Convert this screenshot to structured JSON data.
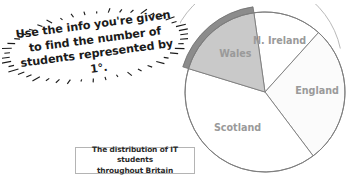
{
  "callout": {
    "name": "instruction-starburst",
    "line1": "Use the info you're given",
    "line2": "to find the number of",
    "line3": "students represented by 1°.",
    "full_text": "Use the info you're given to find the number of students represented by 1°.",
    "rotation_deg": -7.5,
    "ray_count": 46,
    "text_color": "#1b1b1b"
  },
  "caption": {
    "line1": "The distribution of IT students",
    "line2": "throughout Britain",
    "full_text": "The distribution of IT students throughout Britain",
    "border_color": "#b4b4b4",
    "text_color": "#2a2a2a"
  },
  "chart_data": {
    "type": "pie",
    "title": "The distribution of IT students throughout Britain",
    "categories": [
      "N. Ireland",
      "England",
      "Scotland",
      "Wales"
    ],
    "values": [
      50,
      101,
      144,
      65
    ],
    "value_unit": "degrees",
    "labels": [
      "N. Ireland",
      "England",
      "Scotland",
      "Wales"
    ],
    "legend": "none",
    "grid": false,
    "colors": [
      "#ffffff",
      "#fbfbfb",
      "#ffffff",
      "#c9c9c9"
    ],
    "highlight_slice": "Wales",
    "highlight_band_color": "#8c8c8c",
    "stroke_color": "#7d7d7d",
    "label_color": "#9a9a9a",
    "slices": [
      {
        "name": "N. Ireland",
        "angle_deg": 50,
        "start_deg": 352,
        "end_deg": 42,
        "fill": "#ffffff",
        "highlighted": false
      },
      {
        "name": "England",
        "angle_deg": 101,
        "start_deg": 42,
        "end_deg": 143,
        "fill": "#fbfbfb",
        "highlighted": false
      },
      {
        "name": "Scotland",
        "angle_deg": 144,
        "start_deg": 143,
        "end_deg": 287,
        "fill": "#ffffff",
        "highlighted": false
      },
      {
        "name": "Wales",
        "angle_deg": 65,
        "start_deg": 287,
        "end_deg": 352,
        "fill": "#c9c9c9",
        "highlighted": true
      }
    ],
    "geometry": {
      "cx": 85,
      "cy": 88,
      "r": 80
    }
  }
}
